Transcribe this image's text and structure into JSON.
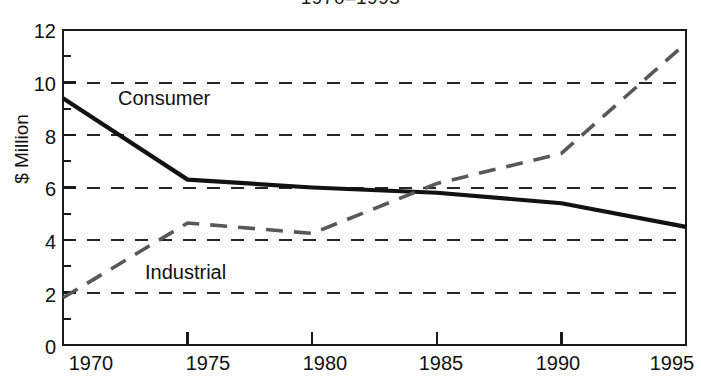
{
  "chart_data": {
    "type": "line",
    "title": "1970–1995",
    "xlabel": "",
    "ylabel": "$ Million",
    "x": [
      1970,
      1975,
      1980,
      1985,
      1990,
      1995
    ],
    "xtick_labels": [
      "1970",
      "1975",
      "1980",
      "1985",
      "1990",
      "1995"
    ],
    "xlim": [
      1970,
      1995
    ],
    "ylim": [
      0,
      12
    ],
    "ytick_labels": [
      "0",
      "2",
      "4",
      "6",
      "8",
      "10",
      "12"
    ],
    "ytick_values": [
      0,
      2,
      4,
      6,
      8,
      10,
      12
    ],
    "yminor_tick_values": [
      1,
      3,
      5,
      7,
      9,
      11
    ],
    "grid": "horizontal-dashed",
    "legend_position": "inline-annotations",
    "series": [
      {
        "name": "Consumer",
        "style": "solid",
        "color": "#121212",
        "linewidth": 4.2,
        "values": [
          9.4,
          6.3,
          6.0,
          5.8,
          5.4,
          4.5
        ]
      },
      {
        "name": "Industrial",
        "style": "dashed",
        "color": "#585858",
        "linewidth": 3.6,
        "values": [
          1.8,
          4.65,
          4.25,
          6.15,
          7.3,
          11.5
        ]
      }
    ],
    "annotations": [
      {
        "label": "Consumer",
        "series": "Consumer"
      },
      {
        "label": "Industrial",
        "series": "Industrial"
      }
    ],
    "colors": {
      "axis": "#1a1a1a",
      "grid": "#262626",
      "background": "#ffffff",
      "consumer": "#121212",
      "industrial": "#585858"
    }
  }
}
